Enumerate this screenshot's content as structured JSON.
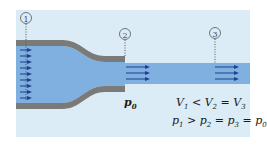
{
  "diagram": {
    "stations": [
      {
        "id": "1",
        "label": "①"
      },
      {
        "id": "2",
        "label": "②"
      },
      {
        "id": "3",
        "label": "③"
      }
    ],
    "ambient_pressure_label": "p0",
    "equations": {
      "velocity": "V1 < V2 = V3",
      "pressure": "p1 > p2 = p3 = p0"
    },
    "colors": {
      "background": "#dcecf6",
      "fluid": "#7fb0e0",
      "pipe_wall": "#7a7a78",
      "arrows": "#1f3f8f"
    }
  }
}
